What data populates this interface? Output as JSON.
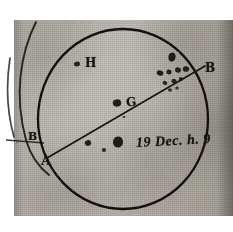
{
  "document": {
    "kind": "manuscript-sunspot-drawing",
    "medium": "aged-paper-scan",
    "ink_color": "#17130f",
    "paper_color": "#b5b1a9"
  },
  "figure": {
    "main_disc": {
      "name": "sun-disc",
      "center_x": 123,
      "center_y": 119,
      "radius": 85
    },
    "partial_disc": {
      "name": "adjacent-sun-disc-fragment",
      "visible_edge": "left"
    },
    "axis_line": {
      "name": "rotation-axis-chord",
      "from_label": "A",
      "to_label": "B"
    }
  },
  "labels": {
    "axis_start": "A",
    "axis_end": "B",
    "neighbor_axis_end": "B",
    "region_letter": "H",
    "center_letter": "G",
    "date_line": "19 Dec. h. 9",
    "date_day": "19",
    "date_month": "Dec.",
    "date_hour_prefix": "h.",
    "date_hour": "9"
  },
  "spots": [
    {
      "name": "spot-upper-left",
      "x": 77,
      "y": 64,
      "rx": 3.0,
      "ry": 2.4,
      "rot": -10,
      "opacity": 0.92
    },
    {
      "name": "spot-center-left",
      "x": 117,
      "y": 103,
      "rx": 4.2,
      "ry": 3.6,
      "rot": -8,
      "opacity": 0.95
    },
    {
      "name": "spot-center-dot",
      "x": 124,
      "y": 117,
      "rx": 1.3,
      "ry": 1.1,
      "rot": 0,
      "opacity": 0.85
    },
    {
      "name": "spot-lower-left-a",
      "x": 88,
      "y": 143,
      "rx": 3.2,
      "ry": 2.8,
      "rot": -14,
      "opacity": 0.9
    },
    {
      "name": "spot-lower-left-b",
      "x": 104,
      "y": 150,
      "rx": 2.2,
      "ry": 2.0,
      "rot": 0,
      "opacity": 0.85
    },
    {
      "name": "spot-lower-ring",
      "x": 118,
      "y": 142,
      "rx": 5.0,
      "ry": 5.6,
      "rot": 5,
      "opacity": 0.95
    },
    {
      "name": "spot-cluster-top",
      "x": 172,
      "y": 57,
      "rx": 3.6,
      "ry": 4.6,
      "rot": 12,
      "opacity": 0.95
    },
    {
      "name": "spot-cluster-a",
      "x": 160,
      "y": 73,
      "rx": 3.4,
      "ry": 2.6,
      "rot": 20,
      "opacity": 0.95
    },
    {
      "name": "spot-cluster-b",
      "x": 169,
      "y": 72,
      "rx": 2.6,
      "ry": 2.4,
      "rot": 10,
      "opacity": 0.92
    },
    {
      "name": "spot-cluster-c",
      "x": 178,
      "y": 70,
      "rx": 3.0,
      "ry": 2.6,
      "rot": 15,
      "opacity": 0.92
    },
    {
      "name": "spot-cluster-d",
      "x": 186,
      "y": 69,
      "rx": 3.2,
      "ry": 2.8,
      "rot": 10,
      "opacity": 0.9
    },
    {
      "name": "spot-cluster-e",
      "x": 165,
      "y": 83,
      "rx": 2.4,
      "ry": 2.0,
      "rot": 25,
      "opacity": 0.88
    },
    {
      "name": "spot-cluster-f",
      "x": 174,
      "y": 81,
      "rx": 2.6,
      "ry": 2.2,
      "rot": 18,
      "opacity": 0.88
    },
    {
      "name": "spot-cluster-g",
      "x": 181,
      "y": 79,
      "rx": 2.2,
      "ry": 1.9,
      "rot": 12,
      "opacity": 0.86
    },
    {
      "name": "spot-cluster-h",
      "x": 170,
      "y": 90,
      "rx": 2.0,
      "ry": 1.7,
      "rot": 0,
      "opacity": 0.8
    },
    {
      "name": "spot-cluster-i",
      "x": 177,
      "y": 88,
      "rx": 1.8,
      "ry": 1.6,
      "rot": 0,
      "opacity": 0.78
    }
  ]
}
